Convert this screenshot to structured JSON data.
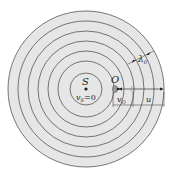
{
  "diagram": {
    "type": "doppler-wavefronts",
    "source": {
      "label": "S",
      "velocity_label": "v",
      "velocity_sub": "S",
      "velocity_value": "=0"
    },
    "observer": {
      "label": "O",
      "velocity_label": "v",
      "velocity_sub": "O"
    },
    "wave_speed_label": "u",
    "wavelength_label": "λ",
    "wavelength_sub": "0",
    "ring_count": 7,
    "colors": {
      "fill": "#e6e6e6",
      "stroke": "#555555",
      "text": "#222222"
    }
  }
}
